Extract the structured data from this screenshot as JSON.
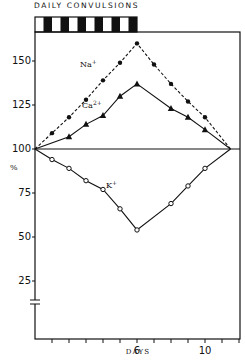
{
  "header": {
    "title": "DAILY CONVULSIONS"
  },
  "chart_data": {
    "type": "line",
    "title": "DAILY CONVULSIONS",
    "xlabel": "DAYS",
    "ylabel": "%",
    "xlim": [
      0,
      12
    ],
    "ylim": [
      15,
      165
    ],
    "x_tick_labels": [
      {
        "value": 6,
        "label": "6"
      },
      {
        "value": 10,
        "label": "10"
      }
    ],
    "x_ticks": [
      1,
      2,
      3,
      4,
      5,
      6,
      7,
      8,
      9,
      10,
      11,
      12
    ],
    "y_tick_labels": [
      "150",
      "125",
      "100",
      "75",
      "50",
      "25"
    ],
    "y_ticks": [
      150,
      125,
      100,
      75,
      50,
      25
    ],
    "reference_line": 100,
    "axis_break": true,
    "convulsion_period_days": [
      0,
      6
    ],
    "convulsion_bar_segments": 12,
    "series": [
      {
        "name": "Na+",
        "label": "Na",
        "superscript": "+",
        "style": "dashed",
        "marker": "filled-circle",
        "x": [
          0,
          1,
          2,
          3,
          4,
          5,
          6,
          7,
          8,
          9,
          10,
          11.5
        ],
        "values": [
          100,
          109,
          118,
          128,
          139,
          149,
          160,
          148,
          137,
          127,
          118,
          100
        ]
      },
      {
        "name": "Ca2+",
        "label": "Ca",
        "superscript": "2+",
        "style": "solid",
        "marker": "filled-triangle",
        "x": [
          0,
          2,
          3,
          4,
          5,
          6,
          8,
          9,
          10,
          11.5
        ],
        "values": [
          100,
          107,
          114,
          119,
          130,
          137,
          123,
          118,
          111,
          100
        ]
      },
      {
        "name": "K+",
        "label": "K",
        "superscript": "+",
        "style": "solid",
        "marker": "open-circle",
        "x": [
          0,
          1,
          2,
          3,
          4,
          5,
          6,
          8,
          9,
          10,
          11.5
        ],
        "values": [
          100,
          94,
          89,
          82,
          77,
          66,
          54,
          69,
          79,
          89,
          100
        ]
      }
    ]
  }
}
